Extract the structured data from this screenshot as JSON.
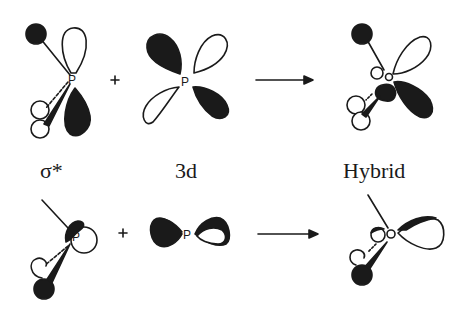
{
  "figure": {
    "atom_label": "P",
    "operators": {
      "plus": "+",
      "arrow": "→"
    },
    "columns": [
      {
        "label": "σ*"
      },
      {
        "label": "3d"
      },
      {
        "label": "Hybrid"
      }
    ],
    "rows": [
      {
        "name": "top-row",
        "description": "orbital combination, view 1"
      },
      {
        "name": "bottom-row",
        "description": "orbital combination, view 2"
      }
    ],
    "colors": {
      "ink": "#1a1a1a",
      "background": "#ffffff",
      "filled_phase": "#1a1a1a",
      "open_phase": "#ffffff"
    }
  }
}
